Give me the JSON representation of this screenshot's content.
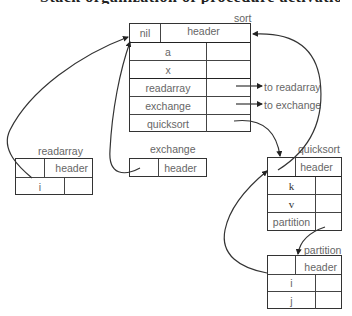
{
  "caption_clipped": "Stack organization of procedure activation records",
  "activation_records": {
    "sort": {
      "title": "sort",
      "header_left": "nil",
      "header_right": "header",
      "rows": [
        {
          "name": "a",
          "pointer_label": ""
        },
        {
          "name": "x",
          "pointer_label": ""
        },
        {
          "name": "readarray",
          "pointer_label": "to readarray"
        },
        {
          "name": "exchange",
          "pointer_label": "to exchange"
        },
        {
          "name": "quicksort",
          "pointer_label": ""
        }
      ]
    },
    "readarray": {
      "title": "readarray",
      "header_right": "header",
      "rows": [
        {
          "name": "i"
        }
      ]
    },
    "exchange": {
      "title": "exchange",
      "header_right": "header",
      "rows": []
    },
    "quicksort": {
      "title": "quicksort",
      "header_right": "header",
      "rows": [
        {
          "name": "k"
        },
        {
          "name": "v"
        },
        {
          "name": "partition"
        }
      ]
    },
    "partition": {
      "title": "partition",
      "header_right": "header",
      "rows": [
        {
          "name": "i"
        },
        {
          "name": "j"
        }
      ]
    }
  },
  "colors": {
    "line": "#333333",
    "text": "#666666",
    "background": "#ffffff"
  }
}
